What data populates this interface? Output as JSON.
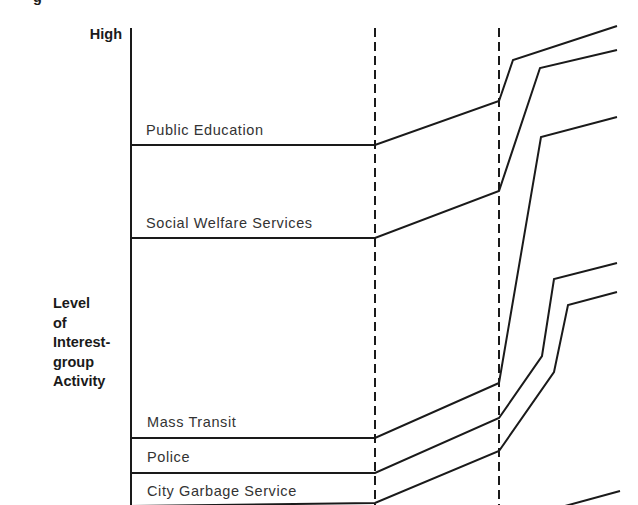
{
  "chart_data": {
    "type": "line",
    "title": "",
    "ylabel": "Level of Interest-group Activity",
    "xlabel": "",
    "y_axis_top_label": "High",
    "grid": false,
    "legend_position": "inline-labels",
    "phase_dividers": 2,
    "series": [
      {
        "name": "Public Education",
        "points": [
          [
            131,
            145
          ],
          [
            375,
            145
          ],
          [
            499,
            101
          ],
          [
            513,
            60
          ],
          [
            617,
            26
          ]
        ]
      },
      {
        "name": "Social Welfare Services",
        "points": [
          [
            131,
            238
          ],
          [
            375,
            238
          ],
          [
            499,
            191
          ],
          [
            540,
            68
          ],
          [
            617,
            50
          ]
        ]
      },
      {
        "name": "Mass Transit",
        "points": [
          [
            131,
            438
          ],
          [
            375,
            438
          ],
          [
            499,
            383
          ],
          [
            541,
            137
          ],
          [
            617,
            117
          ]
        ]
      },
      {
        "name": "Police",
        "points": [
          [
            131,
            473
          ],
          [
            375,
            473
          ],
          [
            499,
            418
          ],
          [
            542,
            356
          ],
          [
            554,
            279
          ],
          [
            617,
            263
          ]
        ]
      },
      {
        "name": "City Garbage Service",
        "points": [
          [
            131,
            506
          ],
          [
            375,
            503
          ],
          [
            499,
            451
          ],
          [
            554,
            372
          ],
          [
            568,
            305
          ],
          [
            617,
            292
          ]
        ]
      }
    ],
    "extra_line": {
      "points": [
        [
          565,
          506
        ],
        [
          620,
          491
        ]
      ]
    }
  },
  "labels": {
    "high": "High",
    "cut_glyph": "g",
    "level_lines": [
      "Level",
      "of",
      "Interest-",
      "group",
      "Activity"
    ],
    "series": {
      "public_education": "Public Education",
      "social_welfare": "Social Welfare Services",
      "mass_transit": "Mass Transit",
      "police": "Police",
      "city_garbage": "City Garbage Service"
    }
  }
}
